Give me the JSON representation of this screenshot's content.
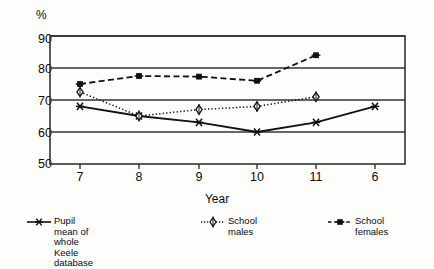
{
  "chart_data": {
    "type": "line",
    "title": "",
    "xlabel": "Year",
    "ylabel": "%",
    "categories": [
      "7",
      "8",
      "9",
      "10",
      "11",
      "6"
    ],
    "ylim": [
      50,
      90
    ],
    "yticks": [
      50,
      60,
      70,
      80,
      90
    ],
    "grid": true,
    "legend_position": "bottom",
    "series": [
      {
        "name": "Pupil mean of whole\nKeele database",
        "marker": "asterisk",
        "linestyle": "solid",
        "values": [
          68,
          65,
          63,
          60,
          63,
          68
        ]
      },
      {
        "name": "School males",
        "marker": "diamond-open",
        "linestyle": "dotted",
        "values": [
          72.5,
          65,
          67,
          68,
          71,
          null
        ]
      },
      {
        "name": "School females",
        "marker": "square-filled",
        "linestyle": "dashed",
        "values": [
          75,
          77.5,
          77.3,
          76,
          84,
          null
        ]
      }
    ]
  },
  "axes": {
    "y_unit_label": "%",
    "x_axis_title": "Year",
    "y_tick_labels": [
      "90",
      "80",
      "70",
      "60",
      "50"
    ],
    "x_tick_labels": [
      "7",
      "8",
      "9",
      "10",
      "11",
      "6"
    ]
  },
  "legend": {
    "items": [
      {
        "label": "Pupil mean of whole\nKeele database",
        "marker": "asterisk-icon"
      },
      {
        "label": "School males",
        "marker": "diamond-open-icon"
      },
      {
        "label": "School females",
        "marker": "square-filled-icon"
      }
    ]
  },
  "colors": {
    "line": "#111111",
    "grid": "#333333",
    "background": "#fdfdfb",
    "text": "#0b0b0b"
  }
}
